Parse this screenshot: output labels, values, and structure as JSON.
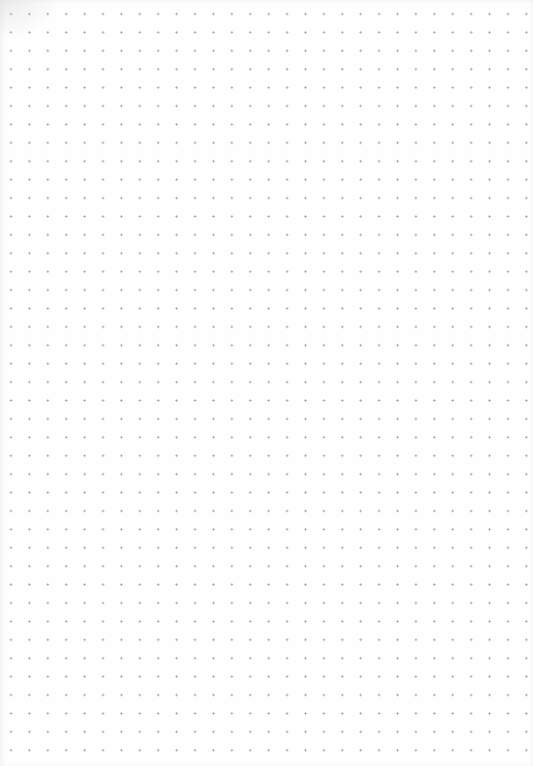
{
  "page": {
    "type": "dot-grid-paper",
    "width": 533,
    "height": 766,
    "background_color": "#fefefe",
    "dot_color": "#9c9c9c",
    "dot_spacing_px": 18.42,
    "first_dot": {
      "x": 11,
      "y": 14
    },
    "columns": 29,
    "rows": 41
  }
}
